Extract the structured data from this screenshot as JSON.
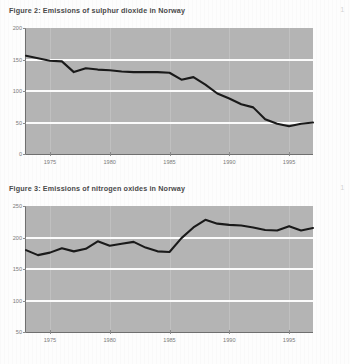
{
  "page": {
    "background_color": "#fdfdfd",
    "plot_background_color": "#b4b4b4",
    "gridline_color": "#fbfbfb",
    "series_color": "#1a1a1a",
    "title_color": "#4a4a4a",
    "margin_mark": "1"
  },
  "figures": [
    {
      "title": "Figure 2: Emissions of sulphur dioxide in Norway",
      "chart_data": {
        "type": "line",
        "title": "Figure 2: Emissions of sulphur dioxide in Norway",
        "xlabel": "",
        "ylabel": "",
        "grid": true,
        "legend": "none",
        "xlim": [
          1973,
          1997
        ],
        "ylim": [
          0,
          200
        ],
        "yticks": [
          0,
          50,
          100,
          150,
          200
        ],
        "ytick_labels": [
          "0",
          "50",
          "100",
          "150",
          "200"
        ],
        "xticks": [
          1975,
          1980,
          1985,
          1990,
          1995
        ],
        "xtick_labels": [
          "1975",
          "1980",
          "1985",
          "1990",
          "1995"
        ],
        "series": [
          {
            "name": "Sulphur dioxide emissions",
            "x": [
              1973,
              1974,
              1975,
              1976,
              1977,
              1978,
              1979,
              1980,
              1981,
              1982,
              1983,
              1984,
              1985,
              1986,
              1987,
              1988,
              1989,
              1990,
              1991,
              1992,
              1993,
              1994,
              1995,
              1996,
              1997
            ],
            "values": [
              156,
              152,
              148,
              147,
              130,
              136,
              134,
              133,
              131,
              130,
              130,
              130,
              129,
              118,
              122,
              110,
              96,
              88,
              79,
              74,
              55,
              48,
              44,
              48,
              50
            ]
          }
        ]
      }
    },
    {
      "title": "Figure 3: Emissions of nitrogen oxides in Norway",
      "chart_data": {
        "type": "line",
        "title": "Figure 3: Emissions of nitrogen oxides in Norway",
        "xlabel": "",
        "ylabel": "",
        "grid": true,
        "legend": "none",
        "xlim": [
          1973,
          1997
        ],
        "ylim": [
          50,
          250
        ],
        "yticks": [
          50,
          100,
          150,
          200,
          250
        ],
        "ytick_labels": [
          "50",
          "100",
          "150",
          "200",
          "250"
        ],
        "xticks": [
          1975,
          1980,
          1985,
          1990,
          1995
        ],
        "xtick_labels": [
          "1975",
          "1980",
          "1985",
          "1990",
          "1995"
        ],
        "series": [
          {
            "name": "Nitrogen oxides emissions",
            "x": [
              1973,
              1974,
              1975,
              1976,
              1977,
              1978,
              1979,
              1980,
              1981,
              1982,
              1983,
              1984,
              1985,
              1986,
              1987,
              1988,
              1989,
              1990,
              1991,
              1992,
              1993,
              1994,
              1995,
              1996,
              1997
            ],
            "values": [
              180,
              172,
              176,
              183,
              178,
              182,
              194,
              187,
              190,
              193,
              184,
              178,
              177,
              199,
              216,
              228,
              222,
              220,
              219,
              216,
              212,
              211,
              218,
              211,
              215
            ]
          }
        ]
      }
    }
  ]
}
